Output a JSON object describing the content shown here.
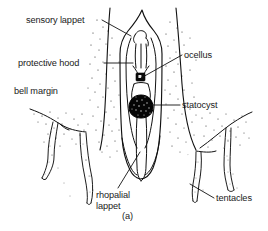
{
  "figure": {
    "caption": "(a)",
    "style": {
      "ink": "#111111",
      "background": "#ffffff",
      "stipple": "#2b2b2b",
      "fill_dark": "#000000"
    },
    "labels": [
      {
        "id": "sensory-lappet",
        "text": "sensory lappet",
        "x": 26,
        "y": 15,
        "leader": {
          "from": [
            102,
            20
          ],
          "to": [
            131,
            36
          ]
        }
      },
      {
        "id": "protective-hood",
        "text": "protective hood",
        "x": 18,
        "y": 58,
        "leader": {
          "from": [
            104,
            63
          ],
          "to": [
            133,
            63
          ]
        }
      },
      {
        "id": "bell-margin",
        "text": "bell margin",
        "x": 14,
        "y": 86,
        "leader": null
      },
      {
        "id": "ocellus",
        "text": "ocellus",
        "x": 184,
        "y": 50,
        "leader": {
          "from": [
            182,
            55
          ],
          "to": [
            141,
            78
          ]
        }
      },
      {
        "id": "statocyst",
        "text": "statocyst",
        "x": 182,
        "y": 100,
        "leader": {
          "from": [
            180,
            105
          ],
          "to": [
            150,
            105
          ]
        }
      },
      {
        "id": "rhopalial-lappet",
        "text": "rhopalial lappet",
        "line1": "rhopalial",
        "line2": "lappet",
        "x": 96,
        "y": 190,
        "leader": {
          "from": [
            118,
            188
          ],
          "to": [
            140,
            152
          ]
        }
      },
      {
        "id": "tentacles",
        "text": "tentacles",
        "x": 216,
        "y": 193,
        "leader": {
          "from": [
            214,
            198
          ],
          "to": [
            190,
            184
          ]
        }
      }
    ],
    "anatomy": [
      {
        "id": "bell-margin-body",
        "kind": "stippled-region"
      },
      {
        "id": "protective-hood-outline",
        "kind": "outline"
      },
      {
        "id": "rhopalium-stalk",
        "kind": "outline"
      },
      {
        "id": "ocellus-spot",
        "kind": "dark-square",
        "cx": 140,
        "cy": 78
      },
      {
        "id": "statocyst-blob",
        "kind": "dark-blob",
        "cx": 141,
        "cy": 106,
        "r": 11
      },
      {
        "id": "sensory-lappet-pair",
        "kind": "outline"
      },
      {
        "id": "tentacle-left-outer",
        "kind": "outline"
      },
      {
        "id": "tentacle-left-inner",
        "kind": "outline"
      },
      {
        "id": "tentacle-right-inner",
        "kind": "outline"
      },
      {
        "id": "tentacle-right-outer",
        "kind": "outline"
      }
    ]
  }
}
